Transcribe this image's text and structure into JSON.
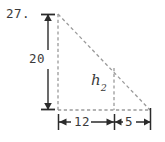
{
  "figure": {
    "problem_number": "27.",
    "type": "geometry-diagram",
    "shape": "right-triangle",
    "colors": {
      "background": "#ffffff",
      "figure_dash_line": "#9a9a9a",
      "dimension_line": "#3a3a3a",
      "text": "#3a3a3a"
    },
    "labels": {
      "height": "20",
      "base_left_segment": "12",
      "base_right_segment": "5",
      "interior_height_symbol": "h",
      "interior_height_subscript": "2"
    },
    "icons": {
      "arrow_left": "arrow-left-icon",
      "arrow_right": "arrow-right-icon",
      "arrow_up": "arrow-up-icon",
      "arrow_down": "arrow-down-icon"
    }
  },
  "geometry": {
    "apex": {
      "x": 58,
      "y": 14
    },
    "bottom_left": {
      "x": 58,
      "y": 110
    },
    "bottom_right": {
      "x": 150,
      "y": 110
    },
    "interior_foot": {
      "x": 114,
      "y": 110
    },
    "interior_top": {
      "x": 114,
      "y": 70
    },
    "vertical_dimension_x": 48,
    "horizontal_dimension_y": 122
  }
}
